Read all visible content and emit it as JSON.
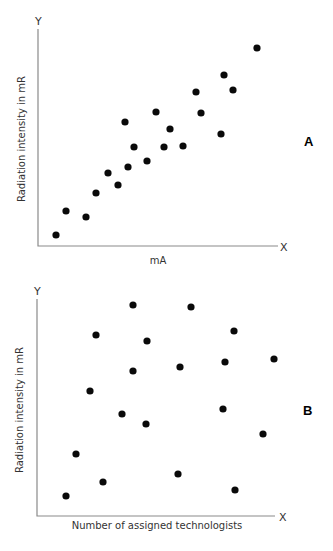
{
  "chart_data": [
    {
      "type": "scatter",
      "panel_label": "A",
      "title": "",
      "xlabel": "mA",
      "ylabel": "Radiation intensity in mR",
      "x_axis_letter": "X",
      "y_axis_letter": "Y",
      "grid": false,
      "ticks": false,
      "relationship": "positive correlation",
      "note": "Unitless relative positions; x and y normalized 0-100 within the plot area",
      "points": [
        {
          "x": 7,
          "y": 6
        },
        {
          "x": 11,
          "y": 17
        },
        {
          "x": 20,
          "y": 14
        },
        {
          "x": 24,
          "y": 25
        },
        {
          "x": 29,
          "y": 34
        },
        {
          "x": 33,
          "y": 28
        },
        {
          "x": 38,
          "y": 37
        },
        {
          "x": 36,
          "y": 57
        },
        {
          "x": 40,
          "y": 45
        },
        {
          "x": 45,
          "y": 39
        },
        {
          "x": 49,
          "y": 61
        },
        {
          "x": 53,
          "y": 45
        },
        {
          "x": 55,
          "y": 54
        },
        {
          "x": 61,
          "y": 46
        },
        {
          "x": 66,
          "y": 70
        },
        {
          "x": 68,
          "y": 61
        },
        {
          "x": 77,
          "y": 51
        },
        {
          "x": 78,
          "y": 79
        },
        {
          "x": 82,
          "y": 72
        },
        {
          "x": 92,
          "y": 91
        }
      ]
    },
    {
      "type": "scatter",
      "panel_label": "B",
      "title": "",
      "xlabel": "Number of assigned technologists",
      "ylabel": "Radiation intensity in mR",
      "x_axis_letter": "X",
      "y_axis_letter": "Y",
      "grid": false,
      "ticks": false,
      "relationship": "no correlation",
      "note": "Unitless relative positions; x and y normalized 0-100 within the plot area",
      "points": [
        {
          "x": 41,
          "y": 97
        },
        {
          "x": 65,
          "y": 96
        },
        {
          "x": 25,
          "y": 84
        },
        {
          "x": 47,
          "y": 81
        },
        {
          "x": 84,
          "y": 86
        },
        {
          "x": 100,
          "y": 73
        },
        {
          "x": 80,
          "y": 72
        },
        {
          "x": 61,
          "y": 70
        },
        {
          "x": 41,
          "y": 68
        },
        {
          "x": 22,
          "y": 59
        },
        {
          "x": 79,
          "y": 50
        },
        {
          "x": 36,
          "y": 48
        },
        {
          "x": 46,
          "y": 43
        },
        {
          "x": 96,
          "y": 38
        },
        {
          "x": 16,
          "y": 29
        },
        {
          "x": 60,
          "y": 20
        },
        {
          "x": 28,
          "y": 16
        },
        {
          "x": 85,
          "y": 12
        },
        {
          "x": 12,
          "y": 10
        }
      ]
    }
  ],
  "charts": {
    "a": {
      "panel_label": "A",
      "xlabel": "mA",
      "ylabel": "Radiation intensity in mR",
      "x_letter": "X",
      "y_letter": "Y",
      "origin": [
        38,
        246
      ],
      "y_top": 29,
      "x_end": 278,
      "dots": [
        [
          56,
          235
        ],
        [
          66,
          211
        ],
        [
          86,
          217
        ],
        [
          96,
          193
        ],
        [
          108,
          173
        ],
        [
          118,
          185
        ],
        [
          128,
          167
        ],
        [
          125,
          122
        ],
        [
          134,
          147
        ],
        [
          147,
          161
        ],
        [
          156,
          112
        ],
        [
          164,
          147
        ],
        [
          170,
          129
        ],
        [
          183,
          146
        ],
        [
          196,
          92
        ],
        [
          201,
          113
        ],
        [
          221,
          134
        ],
        [
          224,
          75
        ],
        [
          233,
          90
        ],
        [
          257,
          48
        ]
      ]
    },
    "b": {
      "panel_label": "B",
      "xlabel": "Number of assigned technologists",
      "ylabel": "Radiation intensity in mR",
      "x_letter": "X",
      "y_letter": "Y",
      "origin": [
        37,
        516
      ],
      "y_top": 299,
      "x_end": 275,
      "dots": [
        [
          133,
          305
        ],
        [
          191,
          307
        ],
        [
          96,
          335
        ],
        [
          147,
          341
        ],
        [
          234,
          331
        ],
        [
          274,
          359
        ],
        [
          225,
          362
        ],
        [
          180,
          367
        ],
        [
          133,
          371
        ],
        [
          90,
          391
        ],
        [
          223,
          409
        ],
        [
          122,
          414
        ],
        [
          146,
          424
        ],
        [
          263,
          434
        ],
        [
          76,
          454
        ],
        [
          178,
          474
        ],
        [
          103,
          482
        ],
        [
          235,
          490
        ],
        [
          66,
          496
        ]
      ]
    }
  }
}
